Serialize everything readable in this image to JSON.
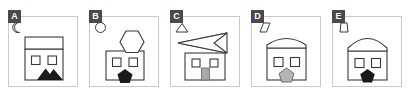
{
  "figure": {
    "type": "panel-strip",
    "panel_count": 5,
    "background_color": "#ffffff",
    "frame_color": "#c9c9c9",
    "badge_bg_color": "#4a4a4a",
    "badge_text_color": "#ffffff",
    "stroke_color": "#3a3a3a",
    "fill_black": "#1a1a1a",
    "fill_gray": "#a8a8a8"
  },
  "panels": [
    {
      "label": "A",
      "corner_shape": "crescent-moon",
      "roof_shape": "rectangle",
      "window_count": 2,
      "door_shape": "none",
      "bottom_shape": "black-mountain",
      "bottom_shape_color": "#1a1a1a"
    },
    {
      "label": "B",
      "corner_shape": "circle",
      "roof_shape": "hexagon",
      "window_count": 2,
      "door_shape": "none",
      "bottom_shape": "black-pentagon",
      "bottom_shape_color": "#1a1a1a"
    },
    {
      "label": "C",
      "corner_shape": "triangle",
      "roof_shape": "left-arrow-ribbon",
      "window_count": 2,
      "door_shape": "gray-rectangle-door",
      "bottom_shape": "none",
      "bottom_shape_color": "#a8a8a8"
    },
    {
      "label": "D",
      "corner_shape": "parallelogram",
      "roof_shape": "curved-dome-low",
      "window_count": 2,
      "door_shape": "none",
      "bottom_shape": "gray-pentagon",
      "bottom_shape_color": "#a8a8a8"
    },
    {
      "label": "E",
      "corner_shape": "narrow-trapezoid",
      "roof_shape": "curved-dome-tall",
      "window_count": 2,
      "door_shape": "none",
      "bottom_shape": "black-pentagon",
      "bottom_shape_color": "#1a1a1a"
    }
  ]
}
